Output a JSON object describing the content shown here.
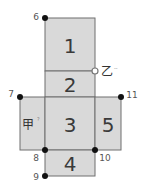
{
  "diagram": {
    "type": "cube-net",
    "faces": [
      {
        "id": "1",
        "label": "1"
      },
      {
        "id": "2",
        "label": "2"
      },
      {
        "id": "3",
        "label": "3"
      },
      {
        "id": "4",
        "label": "4"
      },
      {
        "id": "5",
        "label": "5"
      },
      {
        "id": "jia",
        "label": "甲",
        "note": "?"
      }
    ],
    "points": [
      {
        "label": "6"
      },
      {
        "label": "7"
      },
      {
        "label": "8"
      },
      {
        "label": "9"
      },
      {
        "label": "10"
      },
      {
        "label": "11"
      }
    ],
    "marker_yi": {
      "label": "乙",
      "note": "--"
    },
    "colors": {
      "face_fill": "#d9d9d9",
      "edge": "#6f6f6f",
      "dot": "#111111"
    }
  }
}
